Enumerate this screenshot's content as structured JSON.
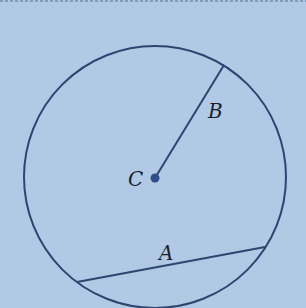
{
  "diagram": {
    "type": "circle-geometry",
    "colors": {
      "background": "#b1c9e5",
      "stroke": "#2f4470",
      "center_dot": "#2f4f8a",
      "label": "#1a1f2e"
    },
    "circle": {
      "cx": 155,
      "cy": 177,
      "r": 131
    },
    "center": {
      "label": "C",
      "x": 155,
      "y": 178
    },
    "radius_segment": {
      "label": "B",
      "x1": 155,
      "y1": 178,
      "x2": 224,
      "y2": 65
    },
    "chord": {
      "label": "A",
      "x1": 77,
      "y1": 282,
      "x2": 265,
      "y2": 247
    },
    "labels": {
      "A": "A",
      "B": "B",
      "C": "C"
    }
  }
}
